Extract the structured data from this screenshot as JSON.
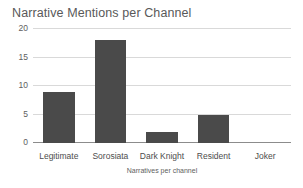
{
  "chart_data": {
    "type": "bar",
    "title": "Narrative Mentions per Channel",
    "xlabel": "Narratives per channel",
    "ylabel": "",
    "categories": [
      "Legitimate",
      "Sorosiata",
      "Dark Knight",
      "Resident",
      "Joker"
    ],
    "values": [
      9,
      18,
      2,
      5,
      0
    ],
    "ylim": [
      0,
      20
    ],
    "yticks": [
      0,
      5,
      10,
      15,
      20
    ],
    "ytick_labels": [
      "0",
      "5",
      "10",
      "15",
      "20"
    ],
    "grid": true,
    "legend": false,
    "series": [
      {
        "name": "Narrative Mentions",
        "values": [
          9,
          18,
          2,
          5,
          0
        ]
      }
    ],
    "colors": {
      "bar": "#4a4a4a",
      "gridline": "#d9d9d9",
      "axis": "#8c8c8c",
      "title_text": "#595959",
      "tick_text": "#4d4d4d",
      "background": "#ffffff"
    }
  }
}
